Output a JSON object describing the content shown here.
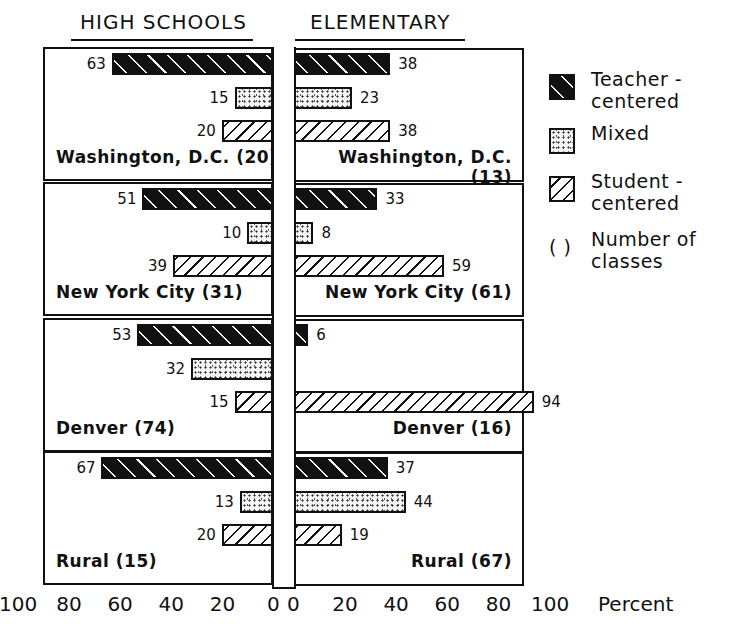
{
  "chart_data": {
    "type": "bar",
    "orientation": "horizontal-back-to-back",
    "title": "",
    "left_header": "HIGH SCHOOLS",
    "right_header": "ELEMENTARY",
    "xlabel": "Percent",
    "xlim": [
      0,
      100
    ],
    "left_ticks": [
      "100",
      "80",
      "60",
      "40",
      "20",
      "0"
    ],
    "right_ticks": [
      "0",
      "20",
      "40",
      "60",
      "80",
      "100"
    ],
    "series_names": [
      "Teacher-centered",
      "Mixed",
      "Student-centered"
    ],
    "groups": [
      {
        "name": "Washington, D.C.",
        "high_school": {
          "label": "Washington, D.C. (20)",
          "classes": 20,
          "teacher": 63,
          "mixed": 15,
          "student": 20
        },
        "elementary": {
          "label": "Washington, D.C. (13)",
          "classes": 13,
          "teacher": 38,
          "mixed": 23,
          "student": 38
        }
      },
      {
        "name": "New York City",
        "high_school": {
          "label": "New York City (31)",
          "classes": 31,
          "teacher": 51,
          "mixed": 10,
          "student": 39
        },
        "elementary": {
          "label": "New York City (61)",
          "classes": 61,
          "teacher": 33,
          "mixed": 8,
          "student": 59
        }
      },
      {
        "name": "Denver",
        "high_school": {
          "label": "Denver  (74)",
          "classes": 74,
          "teacher": 53,
          "mixed": 32,
          "student": 15
        },
        "elementary": {
          "label": "Denver  (16)",
          "classes": 16,
          "teacher": 6,
          "mixed": 0,
          "student": 94
        }
      },
      {
        "name": "Rural",
        "high_school": {
          "label": "Rural  (15)",
          "classes": 15,
          "teacher": 67,
          "mixed": 13,
          "student": 20
        },
        "elementary": {
          "label": "Rural  (67)",
          "classes": 67,
          "teacher": 37,
          "mixed": 44,
          "student": 19
        }
      }
    ],
    "legend": {
      "position": "right",
      "items": [
        {
          "pattern": "teacher",
          "label_line1": "Teacher -",
          "label_line2": "centered"
        },
        {
          "pattern": "mixed",
          "label_line1": "Mixed",
          "label_line2": ""
        },
        {
          "pattern": "student",
          "label_line1": "Student -",
          "label_line2": "centered"
        },
        {
          "pattern": "parens",
          "symbol": "( )",
          "label_line1": "Number of",
          "label_line2": "classes"
        }
      ]
    },
    "grid": false
  }
}
